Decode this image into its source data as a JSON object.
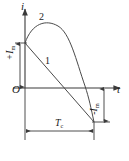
{
  "figure": {
    "type": "waveform-diagram",
    "stroke_color": "#3a3a3a",
    "text_color": "#1a1a1a",
    "background": "#ffffff"
  },
  "axes": {
    "vertical": {
      "label": "i",
      "name": "current-axis"
    },
    "horizontal": {
      "label": "t",
      "name": "time-axis"
    },
    "origin": {
      "label": "O"
    }
  },
  "curves": [
    {
      "id": "1",
      "label": "1",
      "shape": "straight-line",
      "description": "Linear falling discharge from positive peak through zero to negative peak"
    },
    {
      "id": "2",
      "label": "2",
      "shape": "curved",
      "description": "Rounded pulse rising to a maximum then falling steeply to negative peak"
    }
  ],
  "dimensions": [
    {
      "name": "positive-peak-current",
      "label_main": "+I",
      "label_sub": "m",
      "orientation": "vertical",
      "position": "left"
    },
    {
      "name": "negative-peak-current",
      "label_main": "-I",
      "label_sub": "m",
      "orientation": "vertical",
      "position": "right"
    },
    {
      "name": "cycle-period",
      "label_main": "T",
      "label_sub": "c",
      "orientation": "horizontal",
      "position": "bottom"
    }
  ]
}
